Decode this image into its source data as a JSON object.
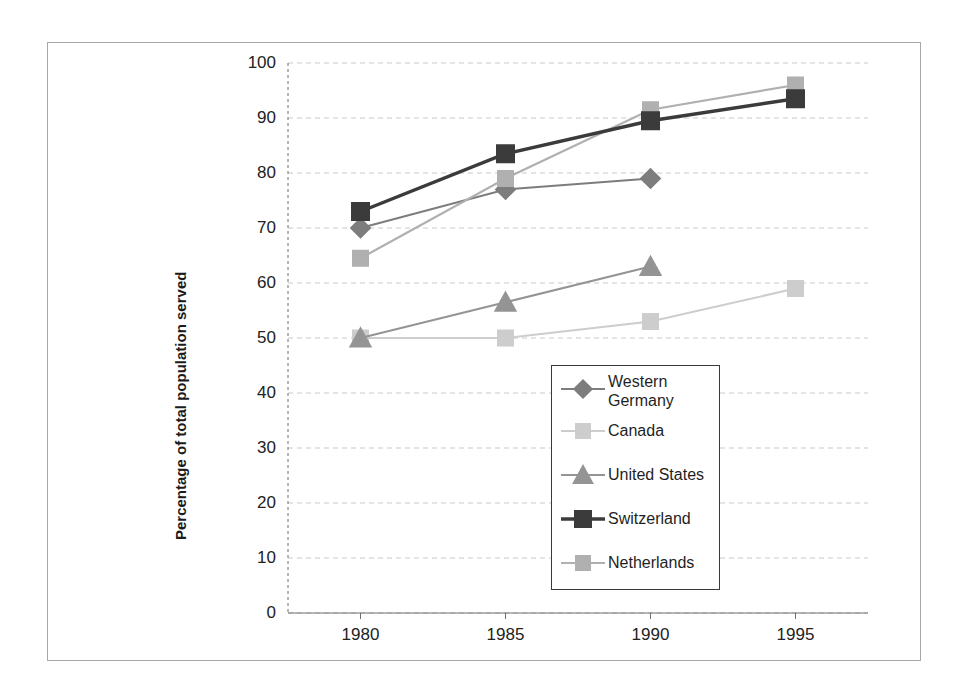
{
  "chart_data": {
    "type": "line",
    "title": "",
    "subtitle": "",
    "xlabel": "",
    "ylabel": "Percentage of total population served",
    "x": [
      1980,
      1985,
      1990,
      1995
    ],
    "categories": [
      "1980",
      "1985",
      "1990",
      "1995"
    ],
    "xtick_labels": [
      "1980",
      "1985",
      "1990",
      "1995"
    ],
    "ytick_labels": [
      "0",
      "10",
      "20",
      "30",
      "40",
      "50",
      "60",
      "70",
      "80",
      "90",
      "100"
    ],
    "ytick_values": [
      0,
      10,
      20,
      30,
      40,
      50,
      60,
      70,
      80,
      90,
      100
    ],
    "ylim": [
      0,
      100
    ],
    "xlim": [
      1977.5,
      1997.5
    ],
    "grid": "horizontal-dashed",
    "legend_position": "inside-lower-right",
    "series": [
      {
        "name": "Western Germany",
        "marker": "diamond",
        "color": "#7d7d7d",
        "line_width": 2.0,
        "x": [
          1980,
          1985,
          1990
        ],
        "values": [
          70,
          77,
          79
        ]
      },
      {
        "name": "Canada",
        "marker": "square",
        "color": "#cdcdcd",
        "line_width": 2.0,
        "x": [
          1980,
          1985,
          1990,
          1995
        ],
        "values": [
          50,
          50,
          53,
          59
        ]
      },
      {
        "name": "United States",
        "marker": "triangle",
        "color": "#949494",
        "line_width": 2.0,
        "x": [
          1980,
          1985,
          1990
        ],
        "values": [
          50,
          56.5,
          63
        ]
      },
      {
        "name": "Switzerland",
        "marker": "square",
        "color": "#3b3b3b",
        "line_width": 3.4,
        "x": [
          1980,
          1985,
          1990,
          1995
        ],
        "values": [
          73,
          83.5,
          89.5,
          93.5
        ]
      },
      {
        "name": "Netherlands",
        "marker": "square",
        "color": "#b0b0b0",
        "line_width": 2.2,
        "x": [
          1980,
          1985,
          1990,
          1995
        ],
        "values": [
          64.5,
          79,
          91.5,
          96
        ]
      }
    ]
  },
  "legend": {
    "entries": [
      {
        "label": "Western Germany",
        "two_line": true
      },
      {
        "label": "Canada",
        "two_line": false
      },
      {
        "label": "United States",
        "two_line": false
      },
      {
        "label": "Switzerland",
        "two_line": false
      },
      {
        "label": "Netherlands",
        "two_line": false
      }
    ]
  },
  "axes": {
    "y_title": "Percentage of total population served"
  },
  "colors": {
    "axis": "#6e6e6e",
    "gridline": "#c9c9c9",
    "frame": "#a8a8a8",
    "text": "#222222"
  }
}
